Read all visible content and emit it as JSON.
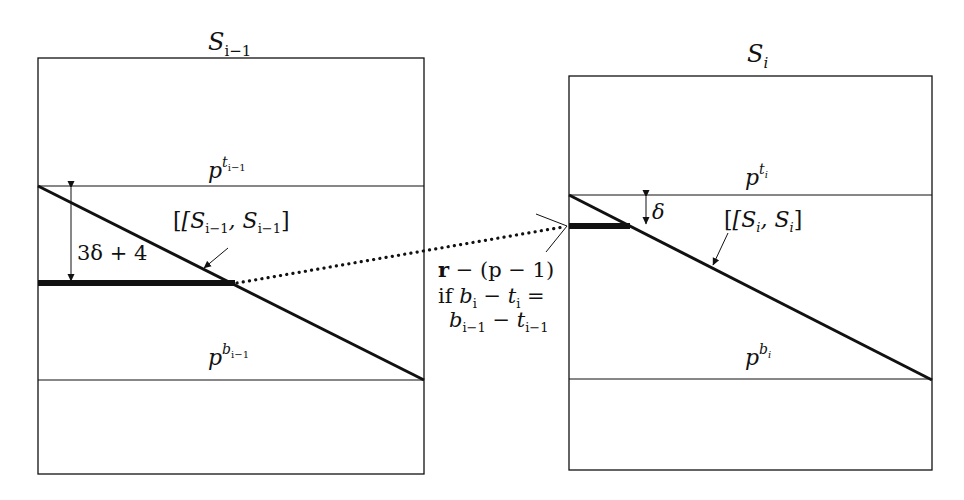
{
  "left_panel": {
    "title": "S",
    "title_sub": "i−1",
    "top_label_base": "p",
    "top_label_sup": "t",
    "top_label_supsub": "i−1",
    "bottom_label_base": "p",
    "bottom_label_sup": "b",
    "bottom_label_supsub": "i−1",
    "segment_label": "[S_{i−1}, S_{i−1}]",
    "segment_label_parts": [
      "[S",
      "i−1",
      ", S",
      "i−1",
      "]"
    ],
    "gap_label": "3δ + 4"
  },
  "right_panel": {
    "title": "S",
    "title_sub": "i",
    "top_label_base": "p",
    "top_label_sup": "t",
    "top_label_supsub": "i",
    "bottom_label_base": "p",
    "bottom_label_sup": "b",
    "bottom_label_supsub": "i",
    "segment_label_parts": [
      "[S",
      "i",
      ", S",
      "i",
      "]"
    ],
    "gap_label": "δ"
  },
  "connector": {
    "line1_bold": "r",
    "line1_rest": " − (p − 1)",
    "line2_prefix": "if ",
    "line2_parts": [
      "b",
      "i",
      " − t",
      "i",
      " ="
    ],
    "line3_parts": [
      "b",
      "i−1",
      " − t",
      "i−1"
    ]
  },
  "colors": {
    "stroke": "#111111",
    "background": "#ffffff"
  }
}
